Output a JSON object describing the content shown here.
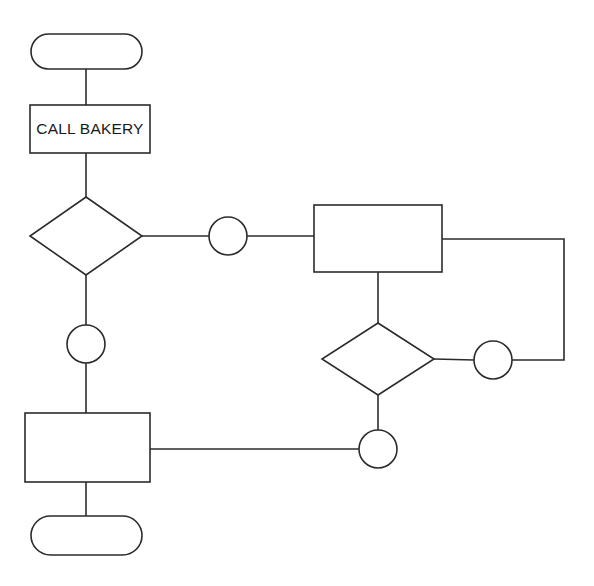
{
  "diagram": {
    "title": "",
    "background_color": "#ffffff",
    "stroke_color": "#2b2b2b",
    "fill_color": "#ffffff",
    "text_color": "#1a1a1a",
    "nodes": [
      {
        "id": "start-terminal",
        "type": "terminator",
        "label": "",
        "x": 31,
        "y": 34,
        "w": 111,
        "h": 35
      },
      {
        "id": "call-bakery-process",
        "type": "process",
        "label": "CALL BAKERY",
        "x": 30,
        "y": 105,
        "w": 120,
        "h": 48
      },
      {
        "id": "decision-left",
        "type": "decision",
        "label": "",
        "cx": 86,
        "cy": 236,
        "rx": 56,
        "ry": 39
      },
      {
        "id": "connector-left-top",
        "type": "connector",
        "label": "",
        "cx": 228,
        "cy": 236,
        "r": 19
      },
      {
        "id": "process-right-top",
        "type": "process",
        "label": "",
        "x": 314,
        "y": 205,
        "w": 128,
        "h": 67
      },
      {
        "id": "decision-right",
        "type": "decision",
        "label": "",
        "cx": 378,
        "cy": 359,
        "rx": 56,
        "ry": 36
      },
      {
        "id": "connector-right",
        "type": "connector",
        "label": "",
        "cx": 493,
        "cy": 360,
        "r": 19
      },
      {
        "id": "connector-left-mid",
        "type": "connector",
        "label": "",
        "cx": 86,
        "cy": 344,
        "r": 19
      },
      {
        "id": "process-left-bottom",
        "type": "process",
        "label": "",
        "x": 25,
        "y": 413,
        "w": 125,
        "h": 69
      },
      {
        "id": "connector-bottom",
        "type": "connector",
        "label": "",
        "cx": 378,
        "cy": 449,
        "r": 19
      },
      {
        "id": "end-terminal",
        "type": "terminator",
        "label": "",
        "x": 31,
        "y": 516,
        "w": 111,
        "h": 39
      }
    ],
    "edges": [
      {
        "id": "edge-start-to-call-bakery",
        "from": "start-terminal",
        "to": "call-bakery-process",
        "path": "M 86 69 L 86 105"
      },
      {
        "id": "edge-call-bakery-to-decision-left",
        "from": "call-bakery-process",
        "to": "decision-left",
        "path": "M 86 153 L 86 197"
      },
      {
        "id": "edge-decision-left-to-connector-top",
        "from": "decision-left",
        "to": "connector-left-top",
        "path": "M 142 236 L 209 236"
      },
      {
        "id": "edge-connector-top-to-process-right",
        "from": "connector-left-top",
        "to": "process-right-top",
        "path": "M 247 236 L 314 236"
      },
      {
        "id": "edge-process-right-to-decision-right",
        "from": "process-right-top",
        "to": "decision-right",
        "path": "M 378 272 L 378 323"
      },
      {
        "id": "edge-decision-right-to-connector-right",
        "from": "decision-right",
        "to": "connector-right",
        "path": "M 434 359 L 474 360"
      },
      {
        "id": "edge-connector-right-loop-back",
        "from": "connector-right",
        "to": "process-right-top",
        "path": "M 512 360 L 564 360 L 564 239 L 442 239"
      },
      {
        "id": "edge-decision-right-to-connector-bottom",
        "from": "decision-right",
        "to": "connector-bottom",
        "path": "M 378 395 L 378 430"
      },
      {
        "id": "edge-connector-bottom-to-process-left",
        "from": "connector-bottom",
        "to": "process-left-bottom",
        "path": "M 359 449 L 150 449"
      },
      {
        "id": "edge-decision-left-to-connector-mid",
        "from": "decision-left",
        "to": "connector-left-mid",
        "path": "M 86 275 L 86 325"
      },
      {
        "id": "edge-connector-mid-to-process-left",
        "from": "connector-left-mid",
        "to": "process-left-bottom",
        "path": "M 86 363 L 86 413"
      },
      {
        "id": "edge-process-left-to-end",
        "from": "process-left-bottom",
        "to": "end-terminal",
        "path": "M 86 482 L 86 516"
      }
    ]
  }
}
